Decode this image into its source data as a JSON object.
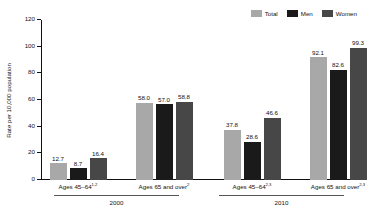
{
  "chart_data": {
    "type": "bar",
    "title": "",
    "xlabel": "",
    "ylabel": "Rate per 10,000 population",
    "ylim": [
      0,
      120
    ],
    "yticks": [
      0,
      20,
      40,
      60,
      80,
      100,
      120
    ],
    "grid": false,
    "legend_position": "top-right",
    "legend": [
      "Total",
      "Men",
      "Women"
    ],
    "series": [
      {
        "name": "Total",
        "color": "#a8a8a8",
        "values": [
          12.7,
          58.0,
          37.8,
          92.1
        ]
      },
      {
        "name": "Men",
        "color": "#1a1a1a",
        "values": [
          8.7,
          57.0,
          28.6,
          82.6
        ]
      },
      {
        "name": "Women",
        "color": "#474747",
        "values": [
          16.4,
          58.8,
          46.6,
          99.3
        ]
      }
    ],
    "categories": [
      {
        "label": "Ages 45–64",
        "superscript": "1,2",
        "period": "2000"
      },
      {
        "label": "Ages 65 and over",
        "superscript": "2",
        "period": "2000"
      },
      {
        "label": "Ages 45–64",
        "superscript": "2,3",
        "period": "2010"
      },
      {
        "label": "Ages 65 and over",
        "superscript": "2,3",
        "period": "2010"
      }
    ],
    "periods": [
      {
        "name": "2000",
        "category_indices": [
          0,
          1
        ]
      },
      {
        "name": "2010",
        "category_indices": [
          2,
          3
        ]
      }
    ]
  }
}
